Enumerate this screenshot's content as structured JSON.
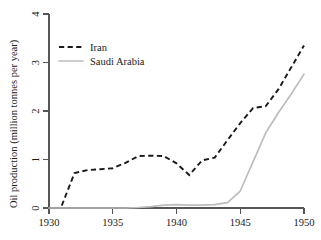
{
  "chart_data": {
    "type": "line",
    "title": "",
    "xlabel": "",
    "ylabel": "Oil production (million tonnes per year)",
    "xlim": [
      1930,
      1950
    ],
    "ylim": [
      0,
      4
    ],
    "xticks": [
      1930,
      1935,
      1940,
      1945,
      1950
    ],
    "yticks": [
      0,
      1,
      2,
      3,
      4
    ],
    "xtick_labels": [
      "1930",
      "1935",
      "1940",
      "1945",
      "1950"
    ],
    "ytick_labels": [
      "0",
      "1",
      "2",
      "3",
      "4"
    ],
    "grid": false,
    "legend_position": "upper left",
    "series": [
      {
        "name": "Iran",
        "style": "dashed",
        "color": "#1a1a1a",
        "x": [
          1931,
          1932,
          1933,
          1934,
          1935,
          1936,
          1937,
          1938,
          1939,
          1940,
          1941,
          1942,
          1943,
          1944,
          1945,
          1946,
          1947,
          1948,
          1949,
          1950
        ],
        "values": [
          0.05,
          0.72,
          0.78,
          0.8,
          0.82,
          0.93,
          1.07,
          1.08,
          1.07,
          0.92,
          0.68,
          0.98,
          1.04,
          1.4,
          1.75,
          2.06,
          2.1,
          2.45,
          2.9,
          3.35
        ]
      },
      {
        "name": "Saudi Arabia",
        "style": "solid",
        "color": "#bdbdbd",
        "x": [
          1930,
          1931,
          1932,
          1933,
          1934,
          1935,
          1936,
          1937,
          1938,
          1939,
          1940,
          1941,
          1942,
          1943,
          1944,
          1945,
          1946,
          1947,
          1948,
          1949,
          1950
        ],
        "values": [
          0.0,
          0.0,
          0.0,
          0.0,
          0.0,
          0.0,
          0.0,
          0.01,
          0.03,
          0.06,
          0.07,
          0.06,
          0.06,
          0.07,
          0.11,
          0.35,
          0.95,
          1.55,
          1.97,
          2.35,
          2.76
        ]
      }
    ]
  },
  "legend": {
    "entries": [
      {
        "label": "Iran",
        "swatch": "dashed-black-line"
      },
      {
        "label": "Saudi Arabia",
        "swatch": "solid-gray-line"
      }
    ]
  }
}
